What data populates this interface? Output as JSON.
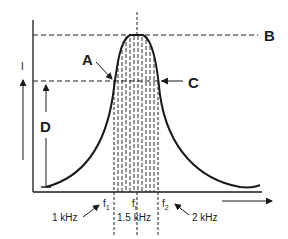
{
  "diagram": {
    "type": "resonance-curve",
    "y_axis_label": "I",
    "callouts": {
      "A": "A",
      "B": "B",
      "C": "C",
      "D": "D"
    },
    "frequencies": {
      "f1": {
        "symbol": "f",
        "subscript": "1",
        "value": "1 kHz"
      },
      "fr": {
        "symbol": "f",
        "subscript": "r",
        "value": "1.5 kHz"
      },
      "f2": {
        "symbol": "f",
        "subscript": "2",
        "value": "2 kHz"
      }
    },
    "colors": {
      "line": "#1a1a1a",
      "background": "#ffffff"
    }
  }
}
